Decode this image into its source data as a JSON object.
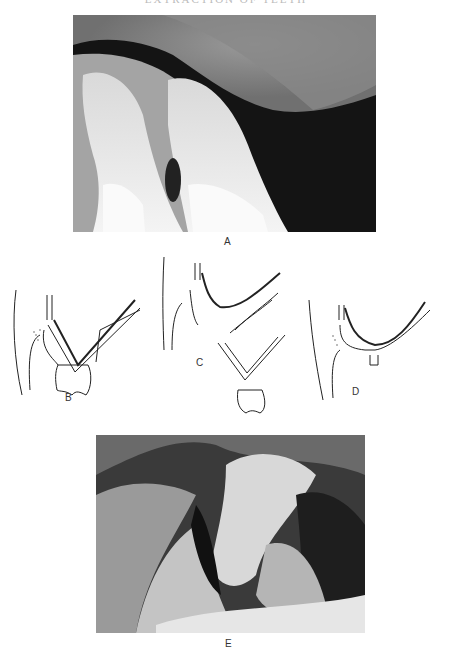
{
  "header": {
    "running_title": "EXTRACTION OF TEETH"
  },
  "figures": {
    "A": {
      "label": "A",
      "kind": "radiograph",
      "subject": "upper molar tooth with maxillary sinus"
    },
    "B": {
      "label": "B",
      "kind": "line-diagram",
      "subject": "molar roots in relation to sinus floor"
    },
    "C": {
      "label": "C",
      "kind": "line-diagram",
      "subject": "tooth extracted with sinus floor fragment"
    },
    "D": {
      "label": "D",
      "kind": "line-diagram",
      "subject": "oro-antral opening after extraction"
    },
    "E": {
      "label": "E",
      "kind": "clinical-photograph",
      "subject": "intra-oral view"
    }
  }
}
